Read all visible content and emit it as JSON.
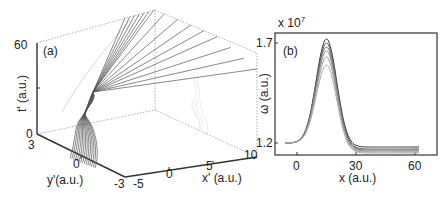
{
  "chart_data": [
    {
      "panel": "(a)",
      "type": "line",
      "projection": "3d",
      "title": "",
      "xlabel": "x' (a.u.)",
      "ylabel": "y'(a.u.)",
      "zlabel": "t' (a.u.)",
      "x_ticks": [
        "-5",
        "0",
        "5",
        "10"
      ],
      "y_ticks": [
        "3",
        "0",
        "-3"
      ],
      "z_ticks": [
        "0",
        "60"
      ],
      "xlim": [
        -5,
        10
      ],
      "ylim": [
        -3,
        3
      ],
      "zlim": [
        0,
        60
      ],
      "description": "Bundle of ~15 trajectories converging to a twisted focus near t'≈30 then fanning out to t'=60; faint shadow projection on back wall",
      "n_trajectories": 15
    },
    {
      "panel": "(b)",
      "type": "line",
      "title": "",
      "xlabel": "x (a.u.)",
      "ylabel": "ω (a.u.)",
      "y_multiplier": "x 10^7",
      "x_ticks": [
        "0",
        "30",
        "60"
      ],
      "y_ticks": [
        "1.2",
        "1.7"
      ],
      "xlim": [
        -10,
        63
      ],
      "ylim": [
        1.13,
        1.76
      ],
      "series": [
        {
          "name": "curve-1",
          "x": [
            -5,
            0,
            5,
            10,
            15,
            20,
            25,
            30,
            40,
            62
          ],
          "values": [
            1.2,
            1.2,
            1.25,
            1.5,
            1.72,
            1.52,
            1.25,
            1.18,
            1.18,
            1.18
          ]
        },
        {
          "name": "curve-2",
          "x": [
            -5,
            0,
            5,
            10,
            15,
            20,
            25,
            30,
            40,
            62
          ],
          "values": [
            1.2,
            1.2,
            1.25,
            1.49,
            1.7,
            1.5,
            1.24,
            1.17,
            1.17,
            1.17
          ]
        },
        {
          "name": "curve-3",
          "x": [
            -5,
            0,
            5,
            10,
            15,
            20,
            25,
            30,
            40,
            62
          ],
          "values": [
            1.2,
            1.2,
            1.25,
            1.48,
            1.68,
            1.49,
            1.23,
            1.165,
            1.165,
            1.165
          ]
        },
        {
          "name": "curve-4",
          "x": [
            -5,
            0,
            5,
            10,
            15,
            20,
            25,
            30,
            40,
            62
          ],
          "values": [
            1.2,
            1.2,
            1.25,
            1.47,
            1.66,
            1.48,
            1.22,
            1.16,
            1.16,
            1.16
          ]
        },
        {
          "name": "curve-5",
          "x": [
            -5,
            0,
            5,
            10,
            15,
            20,
            25,
            30,
            40,
            62
          ],
          "values": [
            1.2,
            1.2,
            1.24,
            1.45,
            1.63,
            1.46,
            1.21,
            1.155,
            1.155,
            1.155
          ]
        },
        {
          "name": "curve-6",
          "x": [
            -5,
            0,
            5,
            10,
            15,
            20,
            25,
            30,
            40,
            62
          ],
          "values": [
            1.2,
            1.2,
            1.24,
            1.43,
            1.59,
            1.44,
            1.2,
            1.15,
            1.15,
            1.15
          ]
        }
      ]
    }
  ],
  "panel_a": {
    "label": "(a)",
    "zlabel": "t' (a.u.)",
    "ylabel": "y'(a.u.)",
    "xlabel": "x' (a.u.)",
    "z_ticks": {
      "top": "60",
      "bottom": "0"
    },
    "y_ticks": {
      "near": "3",
      "mid": "0",
      "far": "-3"
    },
    "x_ticks": {
      "t1": "-5",
      "t2": "0",
      "t3": "5",
      "t4": "10"
    }
  },
  "panel_b": {
    "label": "(b)",
    "multiplier_base": "x 10",
    "multiplier_exp": "7",
    "ylabel": "ω (a.u.)",
    "xlabel": "x (a.u.)",
    "y_ticks": {
      "top": "1.7",
      "bottom": "1.2"
    },
    "x_ticks": {
      "t1": "0",
      "t2": "30",
      "t3": "60"
    }
  }
}
